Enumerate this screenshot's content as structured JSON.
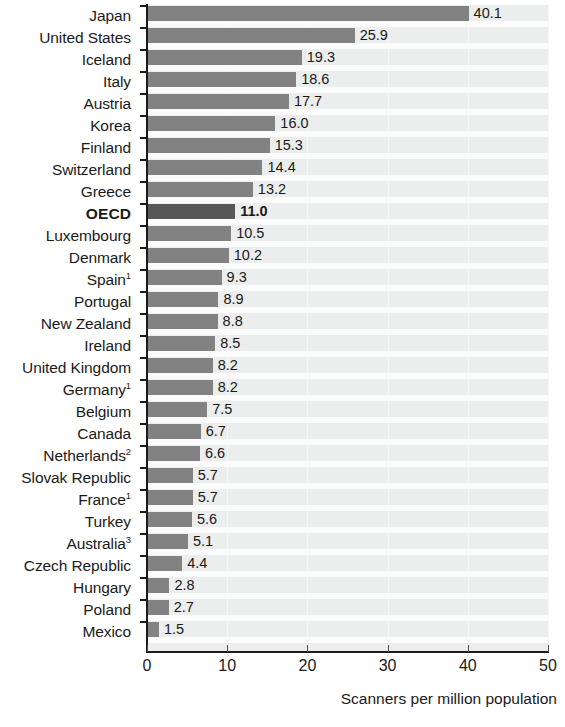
{
  "chart_data": {
    "type": "bar",
    "orientation": "horizontal",
    "title": "",
    "xlabel": "Scanners per million population",
    "ylabel": "",
    "xlim": [
      0,
      50
    ],
    "xticks": [
      0,
      10,
      20,
      30,
      40,
      50
    ],
    "grid": "vertical-faint",
    "legend": "none",
    "highlight_category": "OECD",
    "colors": {
      "bar": "#828282",
      "bar_highlight": "#575757",
      "plot_background": "#eceded",
      "row_separator": "#fbfbfb",
      "axis": "#1a1a1a",
      "text": "#1a1a1a"
    },
    "categories": [
      "Japan",
      "United States",
      "Iceland",
      "Italy",
      "Austria",
      "Korea",
      "Finland",
      "Switzerland",
      "Greece",
      "OECD",
      "Luxembourg",
      "Denmark",
      "Spain",
      "Portugal",
      "New Zealand",
      "Ireland",
      "United Kingdom",
      "Germany",
      "Belgium",
      "Canada",
      "Netherlands",
      "Slovak Republic",
      "France",
      "Turkey",
      "Australia",
      "Czech Republic",
      "Hungary",
      "Poland",
      "Mexico"
    ],
    "category_footnotes": {
      "Spain": "1",
      "Germany": "1",
      "Netherlands": "2",
      "France": "1",
      "Australia": "3"
    },
    "values": [
      40.1,
      25.9,
      19.3,
      18.6,
      17.7,
      16.0,
      15.3,
      14.4,
      13.2,
      11.0,
      10.5,
      10.2,
      9.3,
      8.9,
      8.8,
      8.5,
      8.2,
      8.2,
      7.5,
      6.7,
      6.6,
      5.7,
      5.7,
      5.6,
      5.1,
      4.4,
      2.8,
      2.7,
      1.5
    ],
    "value_labels": [
      "40.1",
      "25.9",
      "19.3",
      "18.6",
      "17.7",
      "16.0",
      "15.3",
      "14.4",
      "13.2",
      "11.0",
      "10.5",
      "10.2",
      "9.3",
      "8.9",
      "8.8",
      "8.5",
      "8.2",
      "8.2",
      "7.5",
      "6.7",
      "6.6",
      "5.7",
      "5.7",
      "5.6",
      "5.1",
      "4.4",
      "2.8",
      "2.7",
      "1.5"
    ],
    "xtick_labels": [
      "0",
      "10",
      "20",
      "30",
      "40",
      "50"
    ]
  }
}
